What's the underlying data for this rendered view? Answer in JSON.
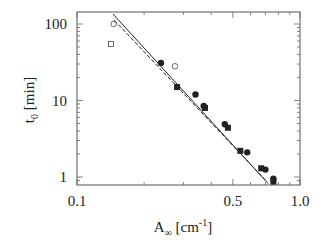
{
  "chart_data": {
    "type": "scatter",
    "title": "",
    "xlabel": "A",
    "xlabel_sub": "∞",
    "xlabel_unit_pre": " [cm",
    "xlabel_unit_sup": "-1",
    "xlabel_unit_post": "]",
    "ylabel": "t",
    "ylabel_sub": "0",
    "ylabel_unit": " [min]",
    "xscale": "log",
    "yscale": "log",
    "xlim": [
      0.1,
      1.0
    ],
    "ylim": [
      0.85,
      140
    ],
    "xticks": [
      {
        "value": 0.1,
        "label": "0.1"
      },
      {
        "value": 0.5,
        "label": "0.5"
      },
      {
        "value": 1.0,
        "label": "1.0"
      }
    ],
    "yticks": [
      {
        "value": 1,
        "label": "1"
      },
      {
        "value": 10,
        "label": "10"
      },
      {
        "value": 100,
        "label": "100"
      }
    ],
    "grid": false,
    "legend": "none",
    "series": [
      {
        "name": "open-squares",
        "marker": "square-open",
        "points": [
          [
            0.142,
            55
          ]
        ]
      },
      {
        "name": "open-circles",
        "marker": "circle-open",
        "points": [
          [
            0.146,
            100
          ],
          [
            0.275,
            28
          ]
        ]
      },
      {
        "name": "filled-circles",
        "marker": "circle-filled",
        "points": [
          [
            0.238,
            31
          ],
          [
            0.34,
            12
          ],
          [
            0.37,
            8.5
          ],
          [
            0.46,
            4.9
          ],
          [
            0.58,
            2.1
          ],
          [
            0.7,
            1.25
          ],
          [
            0.76,
            0.95
          ]
        ]
      },
      {
        "name": "filled-squares",
        "marker": "square-filled",
        "points": [
          [
            0.281,
            15
          ],
          [
            0.375,
            8.0
          ],
          [
            0.475,
            4.4
          ],
          [
            0.54,
            2.2
          ],
          [
            0.67,
            1.3
          ],
          [
            0.76,
            0.87
          ]
        ]
      }
    ],
    "fit_lines": [
      {
        "name": "fit-solid",
        "style": "solid",
        "from": [
          0.145,
          135
        ],
        "to": [
          0.72,
          0.82
        ]
      },
      {
        "name": "fit-dashed",
        "style": "dashed",
        "from": [
          0.147,
          112
        ],
        "to": [
          0.7,
          0.91
        ]
      }
    ]
  }
}
